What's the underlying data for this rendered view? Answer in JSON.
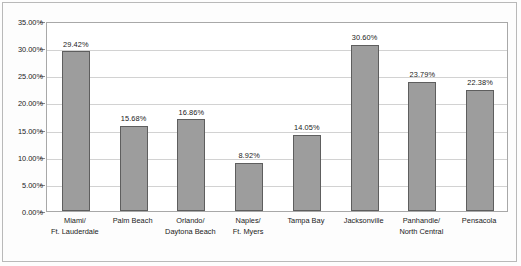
{
  "chart_data": {
    "type": "bar",
    "title": "",
    "subtitle": "",
    "xlabel": "",
    "ylabel": "",
    "ylim": [
      0,
      35
    ],
    "ytick_labels": [
      "35.00%",
      "30.00%",
      "25.00%",
      "20.00%",
      "15.00%",
      "10.00%",
      "5.00%",
      "0.00%"
    ],
    "ytick_values": [
      35,
      30,
      25,
      20,
      15,
      10,
      5,
      0
    ],
    "grid": "horizontal",
    "legend": "none",
    "bar_color": "#9d9d9d",
    "bar_border_color": "#5e5e5e",
    "categories": [
      "Miami/\nFt. Lauderdale",
      "Palm Beach",
      "Orlando/\nDaytona Beach",
      "Naples/\nFt. Myers",
      "Tampa Bay",
      "Jacksonville",
      "Panhandle/\nNorth Central",
      "Pensacola"
    ],
    "category_lines": [
      [
        "Miami/",
        "Ft. Lauderdale"
      ],
      [
        "Palm Beach"
      ],
      [
        "Orlando/",
        "Daytona Beach"
      ],
      [
        "Naples/",
        "Ft. Myers"
      ],
      [
        "Tampa Bay"
      ],
      [
        "Jacksonville"
      ],
      [
        "Panhandle/",
        "North Central"
      ],
      [
        "Pensacola"
      ]
    ],
    "values": [
      29.42,
      15.68,
      16.86,
      8.92,
      14.05,
      30.6,
      23.79,
      22.38
    ],
    "value_labels": [
      "29.42%",
      "15.68%",
      "16.86%",
      "8.92%",
      "14.05%",
      "30.60%",
      "23.79%",
      "22.38%"
    ]
  }
}
